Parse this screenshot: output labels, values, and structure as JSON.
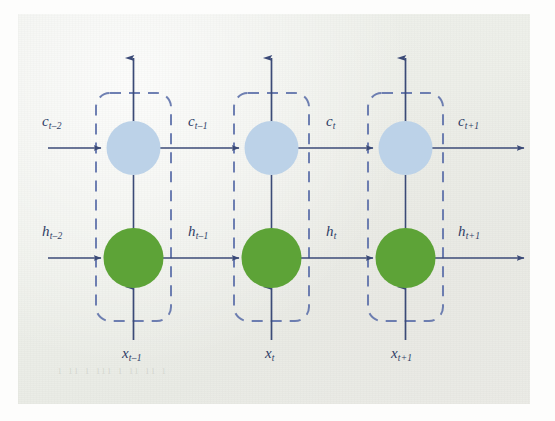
{
  "figure": {
    "type": "diagram",
    "title": "",
    "colors": {
      "cell_state_node": "#bcd2e8",
      "hidden_state_node": "#5da337",
      "arrow": "#3b4a77",
      "dashed_box": "#5b6ea8",
      "label_text": "#2f3d66",
      "page_background": "#ebede8"
    }
  },
  "streams": {
    "cell_state": {
      "name": "cell state",
      "symbol": "c",
      "labels": [
        {
          "base": "c",
          "sub": "t–2"
        },
        {
          "base": "c",
          "sub": "t–1"
        },
        {
          "base": "c",
          "sub": "t"
        },
        {
          "base": "c",
          "sub": "t+1"
        }
      ]
    },
    "hidden_state": {
      "name": "hidden state",
      "symbol": "h",
      "labels": [
        {
          "base": "h",
          "sub": "t–2"
        },
        {
          "base": "h",
          "sub": "t–1"
        },
        {
          "base": "h",
          "sub": "t"
        },
        {
          "base": "h",
          "sub": "t+1"
        }
      ]
    },
    "input": {
      "name": "input",
      "symbol": "x",
      "labels": [
        {
          "base": "x",
          "sub": "t–1"
        },
        {
          "base": "x",
          "sub": "t"
        },
        {
          "base": "x",
          "sub": "t+1"
        }
      ]
    }
  },
  "cells": [
    {
      "index": 0,
      "name": "lstm-cell-t-minus-1",
      "input_label": {
        "base": "x",
        "sub": "t–1"
      },
      "cell_in_label": {
        "base": "c",
        "sub": "t–2"
      },
      "cell_out_label": {
        "base": "c",
        "sub": "t–1"
      },
      "hidden_in_label": {
        "base": "h",
        "sub": "t–2"
      },
      "hidden_out_label": {
        "base": "h",
        "sub": "t–1"
      },
      "has_output_arrow": true
    },
    {
      "index": 1,
      "name": "lstm-cell-t",
      "input_label": {
        "base": "x",
        "sub": "t"
      },
      "cell_in_label": {
        "base": "c",
        "sub": "t–1"
      },
      "cell_out_label": {
        "base": "c",
        "sub": "t"
      },
      "hidden_in_label": {
        "base": "h",
        "sub": "t–1"
      },
      "hidden_out_label": {
        "base": "h",
        "sub": "t"
      },
      "has_output_arrow": true
    },
    {
      "index": 2,
      "name": "lstm-cell-t-plus-1",
      "input_label": {
        "base": "x",
        "sub": "t+1"
      },
      "cell_in_label": {
        "base": "c",
        "sub": "t"
      },
      "cell_out_label": {
        "base": "c",
        "sub": "t+1"
      },
      "hidden_in_label": {
        "base": "h",
        "sub": "t"
      },
      "hidden_out_label": {
        "base": "h",
        "sub": "t+1"
      },
      "has_output_arrow": true
    }
  ],
  "labels_positioned": [
    {
      "name": "label-c-t-minus-2",
      "base": "c",
      "sub": "t–2",
      "x": 42,
      "y": 123
    },
    {
      "name": "label-c-t-minus-1",
      "base": "c",
      "sub": "t–1",
      "x": 188,
      "y": 123
    },
    {
      "name": "label-c-t",
      "base": "c",
      "sub": "t",
      "x": 326,
      "y": 123
    },
    {
      "name": "label-c-t-plus-1",
      "base": "c",
      "sub": "t+1",
      "x": 458,
      "y": 123
    },
    {
      "name": "label-h-t-minus-2",
      "base": "h",
      "sub": "t–2",
      "x": 42,
      "y": 233
    },
    {
      "name": "label-h-t-minus-1",
      "base": "h",
      "sub": "t–1",
      "x": 188,
      "y": 233
    },
    {
      "name": "label-h-t",
      "base": "h",
      "sub": "t",
      "x": 326,
      "y": 233
    },
    {
      "name": "label-h-t-plus-1",
      "base": "h",
      "sub": "t+1",
      "x": 458,
      "y": 233
    },
    {
      "name": "label-x-t-minus-1",
      "base": "x",
      "sub": "t–1",
      "x": 128,
      "y": 352
    },
    {
      "name": "label-x-t",
      "base": "x",
      "sub": "t",
      "x": 268,
      "y": 352
    },
    {
      "name": "label-x-t-plus-1",
      "base": "x",
      "sub": "t+1",
      "x": 396,
      "y": 352
    }
  ],
  "ghost_text": {
    "line": "ı ıı ı ııı ı ıı ıı ı"
  }
}
